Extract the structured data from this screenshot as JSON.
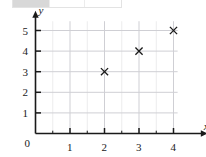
{
  "top_strip": {
    "name": "cropped-table-strip",
    "cells": [
      "",
      "",
      ""
    ]
  },
  "chart_data": {
    "type": "scatter",
    "title": "",
    "xlabel": "x",
    "ylabel": "y",
    "xlim": [
      0,
      4.4
    ],
    "ylim": [
      0,
      5.6
    ],
    "grid": true,
    "grid_major_color": "#cfcfd4",
    "grid_minor_color": "#ececed",
    "axis_color": "#1a1a1a",
    "marker": "x",
    "marker_color": "#1a1a1a",
    "legend": "none",
    "x_ticks": [
      0,
      1,
      2,
      3,
      4
    ],
    "x_tick_labels": [
      "0",
      "1",
      "2",
      "3",
      "4"
    ],
    "y_ticks": [
      1,
      2,
      3,
      4,
      5
    ],
    "y_tick_labels": [
      "1",
      "2",
      "3",
      "4",
      "5"
    ],
    "origin_label": "0",
    "x": [
      2,
      3,
      4
    ],
    "y": [
      3,
      4,
      5
    ],
    "points": [
      {
        "x": 2,
        "y": 3,
        "label": "(2, 3)"
      },
      {
        "x": 3,
        "y": 4,
        "label": "(3, 4)"
      },
      {
        "x": 4,
        "y": 5,
        "label": "(4, 5)"
      }
    ]
  }
}
